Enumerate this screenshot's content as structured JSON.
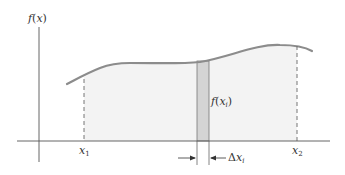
{
  "diagram": {
    "type": "riemann-sum-strip",
    "y_axis_label": {
      "func": "f",
      "arg": "x"
    },
    "x_ticks": [
      {
        "base": "x",
        "sub": "1"
      },
      {
        "base": "x",
        "sub": "2"
      }
    ],
    "strip_label": {
      "func": "f",
      "arg_base": "x",
      "arg_sub": "i"
    },
    "width_label": {
      "delta": "Δ",
      "base": "x",
      "sub": "i"
    },
    "colors": {
      "axis": "#555555",
      "curve": "#8c8c8c",
      "area_fill": "#f3f3f3",
      "strip_fill": "#d4d4d4",
      "strip_edge": "#777777",
      "dashed": "#666666",
      "text": "#333333"
    }
  }
}
